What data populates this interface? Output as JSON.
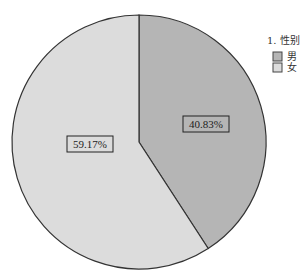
{
  "chart_data": {
    "type": "pie",
    "title": "",
    "legend_title": "1. 性别",
    "legend_position": "right",
    "categories": [
      "男",
      "女"
    ],
    "values": [
      40.83,
      59.17
    ],
    "labels": [
      "40.83%",
      "59.17%"
    ],
    "colors": [
      "#b5b5b5",
      "#dcdcdc"
    ],
    "start_angle": "12 o'clock",
    "direction": "clockwise"
  },
  "legend": {
    "title": "1. 性别",
    "items": [
      {
        "label": "男",
        "color": "#b5b5b5"
      },
      {
        "label": "女",
        "color": "#dcdcdc"
      }
    ]
  },
  "slices": [
    {
      "label": "40.83%"
    },
    {
      "label": "59.17%"
    }
  ]
}
